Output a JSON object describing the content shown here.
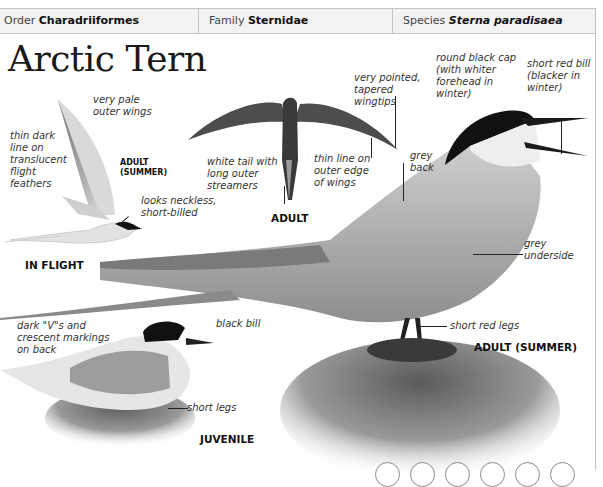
{
  "header": {
    "order_label": "Order",
    "order_value": "Charadriiformes",
    "family_label": "Family",
    "family_value": "Sternidae",
    "species_label": "Species",
    "species_value": "Sterna paradisaea"
  },
  "title": "Arctic Tern",
  "in_flight": {
    "caption": "IN FLIGHT",
    "sub_caption": "ADULT\n(SUMMER)",
    "notes": {
      "pale_wings": "very pale\nouter wings",
      "dark_line": "thin dark\nline on\ntranslucent\nflight\nfeathers",
      "neckless": "looks neckless,\nshort-billed"
    }
  },
  "adult_flying": {
    "caption": "ADULT",
    "notes": {
      "tail": "white tail with\nlong outer\nstreamers",
      "edge": "thin line on\nouter edge\nof wings",
      "wingtips": "very pointed,\ntapered\nwingtips"
    }
  },
  "adult_summer": {
    "caption": "ADULT (SUMMER)",
    "notes": {
      "cap": "round black cap\n(with whiter\nforehead in\nwinter)",
      "bill": "short red bill\n(blacker in\nwinter)",
      "back": "grey\nback",
      "underside": "grey\nunderside",
      "legs": "short red legs"
    }
  },
  "juvenile": {
    "caption": "JUVENILE",
    "notes": {
      "markings": "dark \"V\"s and\ncrescent markings\non back",
      "bill": "black bill",
      "legs": "short legs"
    }
  },
  "colors": {
    "header_bg": "#f2f2f2",
    "border": "#c4c4c4",
    "cap": "#111111",
    "grey_plumage": "#a9a9a9"
  },
  "nav_circles_count": 6
}
